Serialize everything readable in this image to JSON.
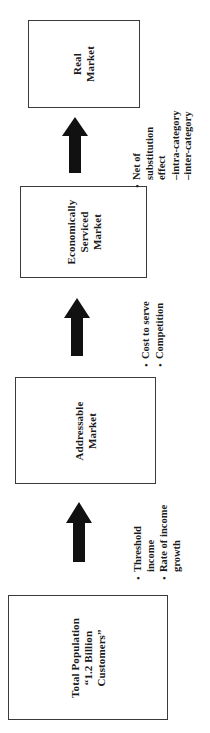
{
  "diagram": {
    "orientation": "rotated-90-ccw",
    "stages": [
      {
        "id": "real-market",
        "label": "Real\nMarket"
      },
      {
        "id": "economically-serviced-market",
        "label": "Economically\nServiced\nMarket"
      },
      {
        "id": "addressable-market",
        "label": "Addressable\nMarket"
      },
      {
        "id": "total-population",
        "label": "Total Population\n“1.2 Billion\nCustomers”"
      }
    ],
    "annotations": [
      {
        "id": "substitution",
        "items": [
          {
            "bullet": "•",
            "text": "Net of\nsubstitution\neffect"
          }
        ],
        "subitems": [
          "–intra-category",
          "–inter-category"
        ]
      },
      {
        "id": "cost-competition",
        "items": [
          {
            "bullet": "•",
            "text": "Cost to serve"
          },
          {
            "bullet": "•",
            "text": "Competition"
          }
        ],
        "subitems": []
      },
      {
        "id": "threshold-income",
        "items": [
          {
            "bullet": "•",
            "text": "Threshold\nincome"
          },
          {
            "bullet": "•",
            "text": "Rate of income\ngrowth"
          }
        ],
        "subitems": []
      }
    ],
    "arrows": [
      {
        "id": "arrow-addressable-to-economic",
        "direction": "up"
      },
      {
        "id": "arrow-economic-to-real",
        "direction": "up"
      },
      {
        "id": "arrow-total-to-addressable",
        "direction": "up"
      }
    ],
    "colors": {
      "box_border": "#3a3a3a",
      "box_fill": "#ffffff",
      "arrow_fill": "#111111",
      "text": "#1a1a1a",
      "background": "#ffffff"
    }
  }
}
